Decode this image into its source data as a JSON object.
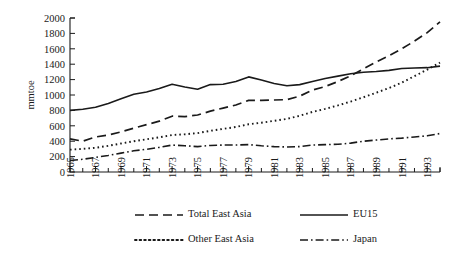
{
  "chart_data": {
    "type": "line",
    "title": "",
    "xlabel": "",
    "ylabel": "mmtoe",
    "ylim": [
      0,
      2000
    ],
    "xlim": [
      1965,
      1994
    ],
    "grid": false,
    "legend_position": "bottom",
    "ytick_labels": [
      "0",
      "200",
      "400",
      "600",
      "800",
      "1000",
      "1200",
      "1400",
      "1600",
      "1800",
      "2000"
    ],
    "ytick_values": [
      0,
      200,
      400,
      600,
      800,
      1000,
      1200,
      1400,
      1600,
      1800,
      2000
    ],
    "xtick_labels": [
      "1965",
      "1967",
      "1969",
      "1971",
      "1973",
      "1975",
      "1977",
      "1979",
      "1981",
      "1983",
      "1985",
      "1987",
      "1989",
      "1991",
      "1993"
    ],
    "xtick_values": [
      1965,
      1967,
      1969,
      1971,
      1973,
      1975,
      1977,
      1979,
      1981,
      1983,
      1985,
      1987,
      1989,
      1991,
      1993
    ],
    "x": [
      1965,
      1966,
      1967,
      1968,
      1969,
      1970,
      1971,
      1972,
      1973,
      1974,
      1975,
      1976,
      1977,
      1978,
      1979,
      1980,
      1981,
      1982,
      1983,
      1984,
      1985,
      1986,
      1987,
      1988,
      1989,
      1990,
      1991,
      1992,
      1993,
      1994
    ],
    "series": [
      {
        "name": "Total East Asia",
        "style": "dashed",
        "values": [
          430,
          400,
          455,
          480,
          520,
          570,
          615,
          660,
          725,
          720,
          740,
          790,
          830,
          870,
          930,
          930,
          935,
          940,
          985,
          1065,
          1110,
          1175,
          1250,
          1340,
          1430,
          1510,
          1600,
          1700,
          1810,
          1950
        ]
      },
      {
        "name": "EU15",
        "style": "solid",
        "values": [
          800,
          815,
          840,
          890,
          950,
          1010,
          1040,
          1085,
          1140,
          1105,
          1075,
          1135,
          1140,
          1175,
          1235,
          1195,
          1150,
          1120,
          1135,
          1175,
          1215,
          1245,
          1275,
          1295,
          1305,
          1320,
          1345,
          1350,
          1355,
          1375
        ]
      },
      {
        "name": "Other East Asia",
        "style": "dotted",
        "values": [
          290,
          300,
          315,
          340,
          370,
          400,
          425,
          450,
          480,
          490,
          505,
          535,
          560,
          585,
          620,
          640,
          665,
          690,
          730,
          780,
          820,
          865,
          915,
          970,
          1030,
          1090,
          1160,
          1245,
          1330,
          1420
        ]
      },
      {
        "name": "Japan",
        "style": "dashdot",
        "values": [
          150,
          165,
          190,
          215,
          245,
          275,
          295,
          320,
          350,
          340,
          330,
          345,
          350,
          350,
          355,
          340,
          330,
          325,
          330,
          350,
          355,
          360,
          375,
          400,
          415,
          430,
          440,
          455,
          470,
          500
        ]
      }
    ]
  },
  "legend": {
    "entries": [
      {
        "label": "Total East Asia",
        "style": "dashed"
      },
      {
        "label": "EU15",
        "style": "solid"
      },
      {
        "label": "Other East Asia",
        "style": "dotted"
      },
      {
        "label": "Japan",
        "style": "dashdot"
      }
    ]
  },
  "colors": {
    "ink": "#1a1a1a",
    "background": "#ffffff"
  }
}
